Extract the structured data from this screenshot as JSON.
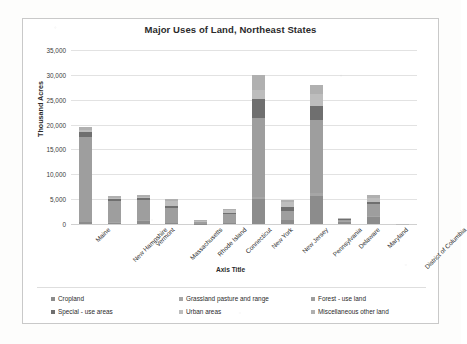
{
  "chart_data": {
    "type": "bar",
    "stacked": true,
    "title": "Major Uses of Land, Northeast States",
    "xlabel": "Axis Title",
    "ylabel": "Thousand Acres",
    "ylim": [
      0,
      35000
    ],
    "yticks": [
      "0",
      "5,000",
      "10,000",
      "15,000",
      "20,000",
      "25,000",
      "30,000",
      "35,000"
    ],
    "ytick_values": [
      0,
      5000,
      10000,
      15000,
      20000,
      25000,
      30000,
      35000
    ],
    "grid": true,
    "legend_position": "bottom",
    "categories": [
      "Maine",
      "New Hampshire",
      "Vermont",
      "Massachusetts",
      "Rhode Island",
      "Connecticut",
      "New York",
      "New Jersey",
      "Pennsylvania",
      "Delaware",
      "Maryland",
      "District of Columbia"
    ],
    "series": [
      {
        "name": "Cropland",
        "color": "#8c8c8c",
        "values": [
          450,
          250,
          700,
          250,
          30,
          250,
          5100,
          800,
          5700,
          500,
          1500,
          0
        ]
      },
      {
        "name": "Grassland pasture and range",
        "color": "#a6a6a6",
        "values": [
          30,
          60,
          120,
          30,
          5,
          40,
          400,
          100,
          600,
          30,
          100,
          0
        ]
      },
      {
        "name": "Forest - use land",
        "color": "#9e9e9e",
        "values": [
          17100,
          4400,
          4000,
          2900,
          370,
          1700,
          15900,
          1800,
          14700,
          370,
          2400,
          0
        ]
      },
      {
        "name": "Special - use areas",
        "color": "#6f6f6f",
        "values": [
          900,
          350,
          500,
          500,
          100,
          300,
          3700,
          700,
          2800,
          120,
          500,
          5
        ]
      },
      {
        "name": "Urban areas",
        "color": "#bdbdbd",
        "values": [
          350,
          250,
          180,
          900,
          200,
          500,
          1900,
          1100,
          2400,
          160,
          800,
          35
        ]
      },
      {
        "name": "Miscellaneous other land",
        "color": "#b0b0b0",
        "values": [
          670,
          300,
          300,
          520,
          95,
          310,
          3000,
          300,
          1800,
          120,
          500,
          0
        ]
      }
    ],
    "totals": [
      19500,
      5610,
      5800,
      5100,
      800,
      3100,
      30000,
      4800,
      28000,
      1300,
      5800,
      40
    ]
  }
}
